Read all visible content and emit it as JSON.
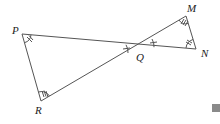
{
  "diagram": {
    "type": "geometry",
    "labels": {
      "P": "P",
      "Q": "Q",
      "R": "R",
      "M": "M",
      "N": "N"
    },
    "points": {
      "P": [
        22,
        34
      ],
      "R": [
        41,
        101
      ],
      "Q": [
        140,
        46
      ],
      "M": [
        186,
        16
      ],
      "N": [
        196,
        49
      ]
    },
    "marks": {
      "angle_P": "double arc tick",
      "angle_R": "triple tick",
      "angle_Q": "single tick (vertical angles)",
      "angle_M": "triple tick",
      "angle_N": "double tick"
    },
    "line_color": "#555555",
    "accent_square_color": "#8a8a8a"
  }
}
